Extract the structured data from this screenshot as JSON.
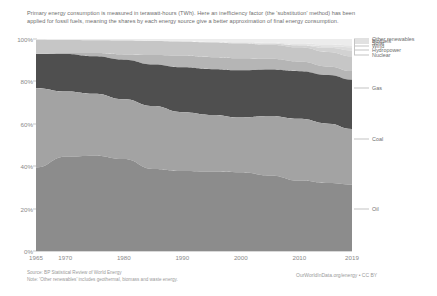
{
  "subtitle": "Primary energy consumption is measured in terawatt-hours (TWh). Here an inefficiency factor (the 'substitution' method) has been applied for fossil fuels, meaning the shares by each energy source give a better approximation of final energy consumption.",
  "axes": {
    "y_ticks": [
      "100%",
      "80%",
      "60%",
      "40%",
      "20%",
      "0%"
    ],
    "x_ticks": [
      "1965",
      "1970",
      "1980",
      "1990",
      "2000",
      "2010",
      "2019"
    ]
  },
  "footer": {
    "source": "Source: BP Statistical Review of World Energy",
    "note": "Note: 'Other renewables' includes geothermal, biomass and waste energy.",
    "credit": "OurWorldInData.org/energy • CC BY"
  },
  "chart_data": {
    "type": "area",
    "xlabel": "",
    "ylabel": "Share of primary energy consumption",
    "xlim": [
      1965,
      2019
    ],
    "ylim": [
      0,
      100
    ],
    "stacked": true,
    "normalized": true,
    "grid": false,
    "legend_position": "right-outside",
    "x": [
      1965,
      1970,
      1975,
      1980,
      1985,
      1990,
      1995,
      2000,
      2005,
      2010,
      2015,
      2019
    ],
    "series": [
      {
        "name": "Oil",
        "color": "#8c8c8c",
        "label_y_pct": 20,
        "values": [
          39.0,
          44.0,
          44.5,
          43.0,
          38.5,
          37.5,
          36.5,
          36.0,
          35.0,
          32.5,
          31.5,
          31.0
        ]
      },
      {
        "name": "Coal",
        "color": "#a3a3a3",
        "label_y_pct": 53,
        "values": [
          37.0,
          30.5,
          29.0,
          28.0,
          29.5,
          27.5,
          26.0,
          25.0,
          27.5,
          28.5,
          27.5,
          26.0
        ]
      },
      {
        "name": "Gas",
        "color": "#4f4f4f",
        "label_y_pct": 77,
        "values": [
          16.0,
          17.5,
          17.5,
          18.5,
          19.5,
          21.0,
          21.0,
          21.5,
          21.5,
          22.0,
          22.5,
          23.0
        ]
      },
      {
        "name": "Nuclear",
        "color": "#b5b5b5",
        "label_y_pct": 92.5,
        "values": [
          0.2,
          0.5,
          1.5,
          2.5,
          4.5,
          5.5,
          5.5,
          5.5,
          5.0,
          4.5,
          4.0,
          4.0
        ]
      },
      {
        "name": "Hydropower",
        "color": "#c6c6c6",
        "label_y_pct": 95.0,
        "values": [
          6.5,
          6.0,
          6.0,
          6.5,
          6.5,
          6.5,
          6.8,
          6.8,
          6.5,
          6.5,
          6.7,
          6.9
        ]
      },
      {
        "name": "Wind",
        "color": "#d2d2d2",
        "label_y_pct": 96.8,
        "values": [
          0.0,
          0.0,
          0.0,
          0.0,
          0.0,
          0.05,
          0.1,
          0.2,
          0.4,
          0.9,
          1.9,
          2.7
        ]
      },
      {
        "name": "Solar",
        "color": "#dcdcdc",
        "label_y_pct": 98.2,
        "values": [
          0.0,
          0.0,
          0.0,
          0.0,
          0.0,
          0.0,
          0.0,
          0.02,
          0.05,
          0.15,
          0.7,
          1.5
        ]
      },
      {
        "name": "Biofuels",
        "color": "#e4e4e4",
        "label_y_pct": 99.1,
        "values": [
          0.0,
          0.0,
          0.0,
          0.0,
          0.05,
          0.1,
          0.15,
          0.3,
          0.5,
          0.7,
          0.8,
          0.9
        ]
      },
      {
        "name": "Other renewables",
        "color": "#ececec",
        "label_y_pct": 99.8,
        "values": [
          0.3,
          0.5,
          0.6,
          0.7,
          0.9,
          1.1,
          1.3,
          1.5,
          1.7,
          2.1,
          2.6,
          3.0
        ]
      }
    ]
  }
}
